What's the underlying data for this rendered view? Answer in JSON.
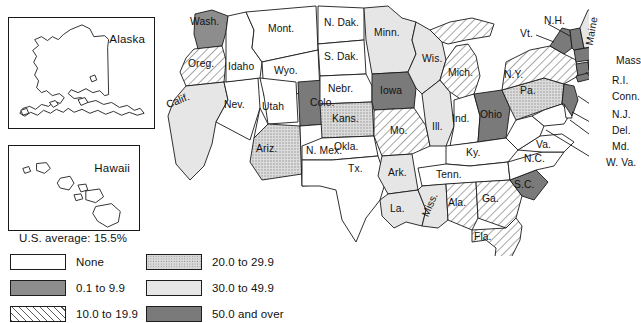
{
  "map": {
    "title_note": "",
    "us_average_label": "U.S. average: 15.5%",
    "insets": [
      {
        "name": "alaska",
        "label": "Alaska",
        "class_index": 0
      },
      {
        "name": "hawaii",
        "label": "Hawaii",
        "class_index": 0
      }
    ],
    "legend": {
      "classes": [
        {
          "key": "none",
          "label": "None",
          "swatch": "p-none",
          "color": "#ffffff"
        },
        {
          "key": "c20_29",
          "label": "20.0 to 29.9",
          "swatch": "p-c",
          "color": "#d9d9d9"
        },
        {
          "key": "c0_9",
          "label": "0.1 to 9.9",
          "swatch": "p-a",
          "color": "#8d8d8d"
        },
        {
          "key": "c30_49",
          "label": "30.0 to 49.9",
          "swatch": "p-d",
          "color": "#e6e6e6"
        },
        {
          "key": "c10_19",
          "label": "10.0 to 19.9",
          "swatch": "p-b",
          "color": "#ffffff"
        },
        {
          "key": "c50_over",
          "label": "50.0 and over",
          "swatch": "p-e",
          "color": "#7a7a7a"
        }
      ]
    },
    "states": [
      {
        "abbr": "Wash.",
        "label": "Wash.",
        "class": "c0_9"
      },
      {
        "abbr": "Oreg.",
        "label": "Oreg.",
        "class": "c10_19"
      },
      {
        "abbr": "Calif.",
        "label": "Calif.",
        "class": "c30_49"
      },
      {
        "abbr": "Nev.",
        "label": "Nev.",
        "class": "none"
      },
      {
        "abbr": "Idaho",
        "label": "Idaho",
        "class": "none"
      },
      {
        "abbr": "Mont.",
        "label": "Mont.",
        "class": "none"
      },
      {
        "abbr": "Wyo.",
        "label": "Wyo.",
        "class": "none"
      },
      {
        "abbr": "Utah",
        "label": "Utah",
        "class": "none"
      },
      {
        "abbr": "Ariz.",
        "label": "Ariz.",
        "class": "c20_29"
      },
      {
        "abbr": "Colo.",
        "label": "Colo.",
        "class": "c50_over"
      },
      {
        "abbr": "N. Mex.",
        "label": "N. Mex.",
        "class": "none"
      },
      {
        "abbr": "N. Dak.",
        "label": "N. Dak.",
        "class": "none"
      },
      {
        "abbr": "S. Dak.",
        "label": "S. Dak.",
        "class": "none"
      },
      {
        "abbr": "Nebr.",
        "label": "Nebr.",
        "class": "none"
      },
      {
        "abbr": "Kans.",
        "label": "Kans.",
        "class": "c20_29"
      },
      {
        "abbr": "Okla.",
        "label": "Okla.",
        "class": "none"
      },
      {
        "abbr": "Tx.",
        "label": "Tx.",
        "class": "none"
      },
      {
        "abbr": "Minn.",
        "label": "Minn.",
        "class": "c30_49"
      },
      {
        "abbr": "Iowa",
        "label": "Iowa",
        "class": "c50_over"
      },
      {
        "abbr": "Mo.",
        "label": "Mo.",
        "class": "c10_19"
      },
      {
        "abbr": "Ark.",
        "label": "Ark.",
        "class": "c30_49"
      },
      {
        "abbr": "La.",
        "label": "La.",
        "class": "c30_49"
      },
      {
        "abbr": "Wis.",
        "label": "Wis.",
        "class": "c30_49"
      },
      {
        "abbr": "Ill.",
        "label": "Ill.",
        "class": "c30_49"
      },
      {
        "abbr": "Mich.",
        "label": "Mich.",
        "class": "c10_19"
      },
      {
        "abbr": "Ind.",
        "label": "Ind.",
        "class": "none"
      },
      {
        "abbr": "Ohio",
        "label": "Ohio",
        "class": "c50_over"
      },
      {
        "abbr": "Ky.",
        "label": "Ky.",
        "class": "none"
      },
      {
        "abbr": "Tenn.",
        "label": "Tenn.",
        "class": "none"
      },
      {
        "abbr": "Miss.",
        "label": "Miss.",
        "class": "c30_49"
      },
      {
        "abbr": "Ala.",
        "label": "Ala.",
        "class": "c10_19"
      },
      {
        "abbr": "Ga.",
        "label": "Ga.",
        "class": "c10_19"
      },
      {
        "abbr": "Fla.",
        "label": "Fla.",
        "class": "c10_19"
      },
      {
        "abbr": "S.C.",
        "label": "S.C.",
        "class": "c50_over"
      },
      {
        "abbr": "N.C.",
        "label": "N.C.",
        "class": "none"
      },
      {
        "abbr": "Va.",
        "label": "Va.",
        "class": "none"
      },
      {
        "abbr": "W. Va.",
        "label": "W. Va.",
        "class": "none"
      },
      {
        "abbr": "Md.",
        "label": "Md.",
        "class": "none"
      },
      {
        "abbr": "Del.",
        "label": "Del.",
        "class": "none"
      },
      {
        "abbr": "Pa.",
        "label": "Pa.",
        "class": "c20_29"
      },
      {
        "abbr": "N.J.",
        "label": "N.J.",
        "class": "c50_over"
      },
      {
        "abbr": "N.Y.",
        "label": "N.Y.",
        "class": "c10_19"
      },
      {
        "abbr": "Conn.",
        "label": "Conn.",
        "class": "c50_over"
      },
      {
        "abbr": "R.I.",
        "label": "R.I.",
        "class": "c50_over"
      },
      {
        "abbr": "Mass",
        "label": "Mass",
        "class": "c50_over"
      },
      {
        "abbr": "Vt.",
        "label": "Vt.",
        "class": "c50_over"
      },
      {
        "abbr": "N.H.",
        "label": "N.H.",
        "class": "c50_over"
      },
      {
        "abbr": "Maine",
        "label": "Maine",
        "class": "c30_49"
      }
    ]
  }
}
